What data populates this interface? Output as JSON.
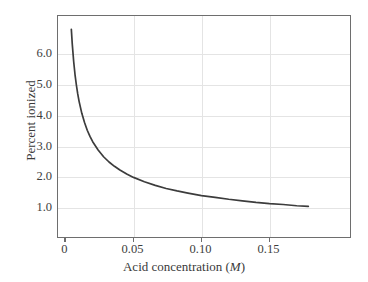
{
  "figure": {
    "background_color": "#ffffff",
    "frame_color": "#6e6e6e",
    "grid_color": "#e4e4e4",
    "curve_color": "#3c3c3c"
  },
  "axes": {
    "x": {
      "title_text": "Acid concentration (",
      "title_unit": "M",
      "title_close": ")",
      "tick_labels": [
        "0",
        "0.05",
        "0.10",
        "0.15"
      ],
      "tick_values": [
        0,
        0.05,
        0.1,
        0.15
      ],
      "range": [
        -0.0055,
        0.2106
      ]
    },
    "y": {
      "title": "Percent ionized",
      "tick_labels": [
        "1.0",
        "2.0",
        "3.0",
        "4.0",
        "5.0",
        "6.0"
      ],
      "tick_values": [
        1.0,
        2.0,
        3.0,
        4.0,
        5.0,
        6.0
      ],
      "range": [
        0.0,
        7.24
      ]
    }
  },
  "chart_data": {
    "type": "line",
    "title": "",
    "xlabel": "Acid concentration (M)",
    "ylabel": "Percent ionized",
    "xlim": [
      -0.0055,
      0.2106
    ],
    "ylim": [
      0.0,
      7.24
    ],
    "grid": true,
    "legend": "none",
    "series": [
      {
        "name": "Percent ionized",
        "relationship": "percent ionized = 0.447 / sqrt(concentration)",
        "x": [
          0.0043,
          0.005,
          0.006,
          0.007,
          0.008,
          0.009,
          0.01,
          0.012,
          0.014,
          0.016,
          0.018,
          0.02,
          0.024,
          0.028,
          0.032,
          0.036,
          0.04,
          0.045,
          0.05,
          0.058,
          0.066,
          0.074,
          0.082,
          0.09,
          0.1,
          0.11,
          0.12,
          0.13,
          0.14,
          0.15,
          0.16,
          0.17,
          0.1785
        ],
        "y": [
          6.81,
          6.32,
          5.77,
          5.34,
          5.0,
          4.71,
          4.47,
          4.08,
          3.78,
          3.53,
          3.33,
          3.16,
          2.89,
          2.67,
          2.5,
          2.36,
          2.24,
          2.11,
          2.0,
          1.86,
          1.74,
          1.64,
          1.56,
          1.49,
          1.41,
          1.35,
          1.29,
          1.24,
          1.19,
          1.15,
          1.12,
          1.08,
          1.06
        ]
      }
    ]
  }
}
